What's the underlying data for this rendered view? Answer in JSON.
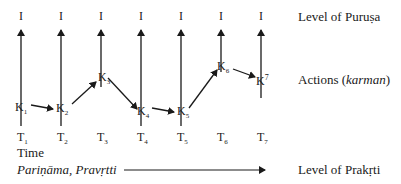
{
  "diagram": {
    "top_markers": [
      "I",
      "I",
      "I",
      "I",
      "I",
      "I",
      "I"
    ],
    "actions": [
      {
        "letter": "K",
        "index": "1",
        "script": "sub"
      },
      {
        "letter": "K",
        "index": "2",
        "script": "sub"
      },
      {
        "letter": "K",
        "index": "3",
        "script": "sub"
      },
      {
        "letter": "K",
        "index": "4",
        "script": "sub"
      },
      {
        "letter": "K",
        "index": "5",
        "script": "sub"
      },
      {
        "letter": "K",
        "index": "6",
        "script": "sub"
      },
      {
        "letter": "K",
        "index": "7",
        "script": "sup"
      }
    ],
    "time_ticks": [
      {
        "letter": "T",
        "index": "1"
      },
      {
        "letter": "T",
        "index": "2"
      },
      {
        "letter": "T",
        "index": "3"
      },
      {
        "letter": "T",
        "index": "4"
      },
      {
        "letter": "T",
        "index": "5"
      },
      {
        "letter": "T",
        "index": "6"
      },
      {
        "letter": "T",
        "index": "7"
      }
    ],
    "time_label": "Time",
    "process_label": "Pariṇāma, Pravṛtti",
    "right_labels": {
      "purusa": "Level of Puruṣa",
      "actions_prefix": "Actions (",
      "actions_term": "karman",
      "actions_suffix": ")",
      "prakrti": "Level of Prakṛti"
    },
    "colors": {
      "ink": "#1a1a1a",
      "background": "#ffffff"
    }
  }
}
